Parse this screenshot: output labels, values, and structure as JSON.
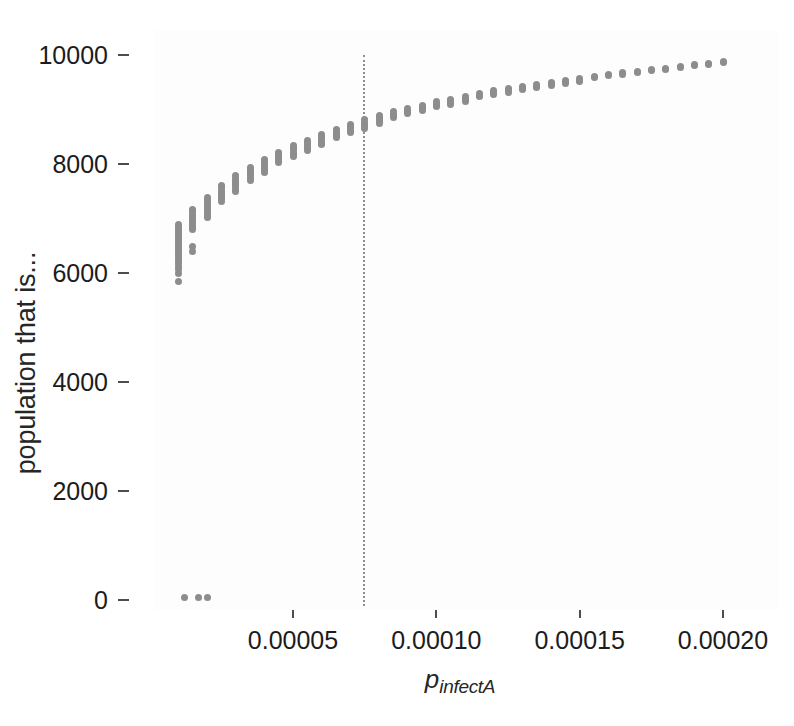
{
  "figure": {
    "width": 794,
    "height": 726,
    "background": "#ffffff",
    "panel_background": "#fdfdfd",
    "point_color": "#8d8d8d",
    "axis_text_color": "#1c1c1c",
    "reference_line_color": "#8e8e8e"
  },
  "axes": {
    "ylabel": "population that is...",
    "xlabel_base": "p",
    "xlabel_sub": "infectA",
    "ytick_labels": [
      "0",
      "2000",
      "4000",
      "6000",
      "8000",
      "10000"
    ],
    "xtick_labels": [
      "0.00005",
      "0.00010",
      "0.00015",
      "0.00020"
    ]
  },
  "chart_data": {
    "type": "scatter",
    "title": "",
    "xlabel": "p_infectA",
    "ylabel": "population that is...",
    "xlim": [
      5e-06,
      0.000208
    ],
    "ylim": [
      -350,
      10450
    ],
    "yticks": [
      0,
      2000,
      4000,
      6000,
      8000,
      10000
    ],
    "xticks": [
      5e-05,
      0.0001,
      0.00015,
      0.0002
    ],
    "grid": false,
    "legend": null,
    "marker": "filled-circle",
    "marker_color": "#8d8d8d",
    "marker_size_px": 7,
    "annotations": [
      {
        "type": "vertical-reference-line",
        "x": 7.43e-05,
        "style": "dotted",
        "color": "#8e8e8e"
      }
    ],
    "series": [
      {
        "name": "replicates",
        "x": [
          1e-05,
          1e-05,
          1e-05,
          1e-05,
          1e-05,
          1e-05,
          1e-05,
          1e-05,
          1e-05,
          1e-05,
          1e-05,
          1e-05,
          1e-05,
          1e-05,
          1e-05,
          1e-05,
          1e-05,
          1e-05,
          1e-05,
          1e-05,
          1e-05,
          1e-05,
          1.5e-05,
          1.5e-05,
          1.5e-05,
          1.5e-05,
          1.5e-05,
          1.5e-05,
          1.5e-05,
          1.5e-05,
          1.5e-05,
          1.5e-05,
          1.5e-05,
          1.5e-05,
          2e-05,
          2e-05,
          2e-05,
          2e-05,
          2e-05,
          2e-05,
          2e-05,
          2e-05,
          2e-05,
          2e-05,
          2.5e-05,
          2.5e-05,
          2.5e-05,
          2.5e-05,
          2.5e-05,
          2.5e-05,
          2.5e-05,
          2.5e-05,
          3e-05,
          3e-05,
          3e-05,
          3e-05,
          3e-05,
          3e-05,
          3e-05,
          3e-05,
          3.5e-05,
          3.5e-05,
          3.5e-05,
          3.5e-05,
          3.5e-05,
          3.5e-05,
          3.5e-05,
          4e-05,
          4e-05,
          4e-05,
          4e-05,
          4e-05,
          4e-05,
          4e-05,
          4.5e-05,
          4.5e-05,
          4.5e-05,
          4.5e-05,
          4.5e-05,
          4.5e-05,
          5e-05,
          5e-05,
          5e-05,
          5e-05,
          5e-05,
          5e-05,
          5.5e-05,
          5.5e-05,
          5.5e-05,
          5.5e-05,
          5.5e-05,
          5.5e-05,
          6e-05,
          6e-05,
          6e-05,
          6e-05,
          6e-05,
          6e-05,
          6.5e-05,
          6.5e-05,
          6.5e-05,
          6.5e-05,
          6.5e-05,
          7e-05,
          7e-05,
          7e-05,
          7e-05,
          7e-05,
          7.5e-05,
          7.5e-05,
          7.5e-05,
          7.5e-05,
          7.5e-05,
          8e-05,
          8e-05,
          8e-05,
          8e-05,
          8e-05,
          8.5e-05,
          8.5e-05,
          8.5e-05,
          8.5e-05,
          9e-05,
          9e-05,
          9e-05,
          9e-05,
          9.5e-05,
          9.5e-05,
          9.5e-05,
          9.5e-05,
          0.0001,
          0.0001,
          0.0001,
          0.0001,
          0.000105,
          0.000105,
          0.000105,
          0.000105,
          0.00011,
          0.00011,
          0.00011,
          0.00011,
          0.000115,
          0.000115,
          0.000115,
          0.00012,
          0.00012,
          0.00012,
          0.000125,
          0.000125,
          0.000125,
          0.00013,
          0.00013,
          0.00013,
          0.000135,
          0.000135,
          0.000135,
          0.00014,
          0.00014,
          0.00014,
          0.000145,
          0.000145,
          0.000145,
          0.00015,
          0.00015,
          0.00015,
          0.000155,
          0.000155,
          0.00016,
          0.00016,
          0.000165,
          0.000165,
          0.00017,
          0.00017,
          0.000175,
          0.000175,
          0.00018,
          0.00018,
          0.000185,
          0.000185,
          0.00019,
          0.00019,
          0.000195,
          0.000195,
          0.0002,
          0.0002,
          1.2e-05,
          1.7e-05,
          2e-05
        ],
        "y": [
          6890,
          6840,
          6800,
          6760,
          6720,
          6680,
          6640,
          6600,
          6560,
          6520,
          6480,
          6440,
          6400,
          6360,
          6320,
          6270,
          6220,
          6170,
          6120,
          6070,
          5990,
          5850,
          7160,
          7120,
          7080,
          7040,
          7000,
          6960,
          6920,
          6880,
          6840,
          6800,
          6480,
          6400,
          7380,
          7340,
          7300,
          7260,
          7220,
          7180,
          7140,
          7100,
          7060,
          7020,
          7600,
          7560,
          7520,
          7480,
          7440,
          7400,
          7360,
          7320,
          7780,
          7740,
          7700,
          7660,
          7620,
          7580,
          7540,
          7500,
          7940,
          7900,
          7860,
          7820,
          7780,
          7740,
          7700,
          8080,
          8040,
          8000,
          7960,
          7920,
          7880,
          7840,
          8220,
          8180,
          8140,
          8100,
          8060,
          8020,
          8340,
          8300,
          8260,
          8220,
          8180,
          8140,
          8440,
          8400,
          8360,
          8320,
          8280,
          8250,
          8540,
          8500,
          8460,
          8420,
          8380,
          8350,
          8640,
          8600,
          8560,
          8520,
          8480,
          8730,
          8690,
          8650,
          8610,
          8580,
          8810,
          8770,
          8730,
          8690,
          8660,
          8890,
          8850,
          8810,
          8780,
          8750,
          8960,
          8920,
          8890,
          8860,
          9020,
          8990,
          8960,
          8930,
          9080,
          9050,
          9020,
          8990,
          9140,
          9110,
          9080,
          9050,
          9190,
          9160,
          9130,
          9100,
          9240,
          9210,
          9180,
          9150,
          9290,
          9260,
          9230,
          9340,
          9310,
          9280,
          9380,
          9350,
          9320,
          9420,
          9390,
          9360,
          9460,
          9430,
          9400,
          9500,
          9470,
          9440,
          9540,
          9510,
          9480,
          9570,
          9540,
          9520,
          9610,
          9580,
          9640,
          9620,
          9670,
          9650,
          9700,
          9680,
          9730,
          9710,
          9760,
          9740,
          9790,
          9770,
          9820,
          9800,
          9850,
          9830,
          9880,
          9860,
          40,
          40,
          40
        ]
      }
    ]
  }
}
